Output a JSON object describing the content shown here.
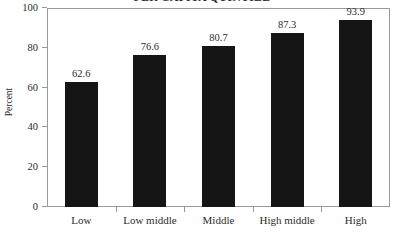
{
  "chart_data": {
    "type": "bar",
    "title": "PER CAPITA QUINTILE",
    "categories": [
      "Low",
      "Low middle",
      "Middle",
      "High middle",
      "High"
    ],
    "values": [
      62.6,
      76.6,
      80.7,
      87.3,
      93.9
    ],
    "value_labels": [
      "62.6",
      "76.6",
      "80.7",
      "87.3",
      "93.9"
    ],
    "xlabel": "",
    "ylabel": "Percent",
    "ylim": [
      0,
      100
    ],
    "yticks": [
      0,
      20,
      40,
      60,
      80,
      100
    ],
    "ytick_labels": [
      "0",
      "20",
      "40",
      "60",
      "80",
      "100"
    ],
    "grid": false,
    "legend": null,
    "bar_color": "#151515",
    "frame_color": "#9a9a9a",
    "background_color": "#ffffff"
  }
}
